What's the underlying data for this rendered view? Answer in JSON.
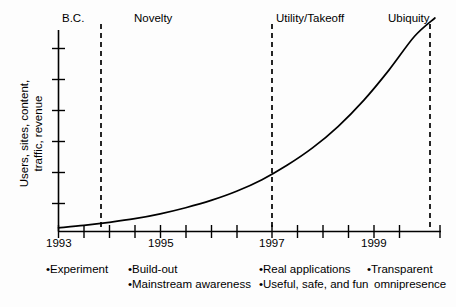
{
  "chart_data": {
    "type": "line",
    "title": "",
    "xlabel": "",
    "ylabel": "Users, sites, content, traffic, revenue",
    "ylabel_lines": [
      "Users, sites, content,",
      "traffic, revenue"
    ],
    "xlim": [
      1993,
      2000.5
    ],
    "ylim": [
      0,
      7
    ],
    "grid": false,
    "legend": null,
    "x_tick_labels": [
      "1993",
      "1995",
      "1997",
      "1999"
    ],
    "x_tick_values": [
      1993,
      1995,
      1997,
      1999
    ],
    "x_minor_tick_values": [
      1993,
      1993.5,
      1994,
      1994.5,
      1995,
      1995.5,
      1996,
      1996.5,
      1997,
      1997.5,
      1998,
      1998.5,
      1999,
      1999.5,
      2000
    ],
    "y_tick_labels": [],
    "y_tick_count": 6,
    "series": [
      {
        "name": "Internet growth",
        "x": [
          1993.0,
          1993.5,
          1994.0,
          1994.5,
          1995.0,
          1995.5,
          1996.0,
          1996.5,
          1997.0,
          1997.5,
          1998.0,
          1998.5,
          1999.0,
          1999.5,
          2000.0,
          2000.4
        ],
        "values": [
          0.12,
          0.2,
          0.3,
          0.42,
          0.58,
          0.78,
          1.02,
          1.32,
          1.7,
          2.18,
          2.75,
          3.45,
          4.3,
          5.3,
          6.4,
          7.0
        ]
      }
    ],
    "phase_boundaries": [
      1994.0,
      1997.0,
      2000.0
    ],
    "phases": [
      {
        "label": "B.C.",
        "center_x": 1993.3
      },
      {
        "label": "Novelty",
        "center_x": 1995.2
      },
      {
        "label": "Utility/Takeoff",
        "center_x": 1997.9
      },
      {
        "label": "Ubiquity",
        "center_x": 2000.2
      }
    ],
    "annotations": [
      {
        "group": "B.C.",
        "items": [
          "•Experiment"
        ]
      },
      {
        "group": "Novelty",
        "items": [
          "•Build-out",
          "•Mainstream awareness"
        ]
      },
      {
        "group": "Utility/Takeoff",
        "items": [
          "•Real applications",
          "•Useful, safe, and fun"
        ]
      },
      {
        "group": "Ubiquity",
        "items": [
          "•Transparent",
          "omnipresence"
        ]
      }
    ],
    "colors": {
      "background": "#fdfdfd",
      "axis": "#000000",
      "curve": "#000000",
      "dashed_divider": "#000000",
      "text": "#000000"
    }
  },
  "phase_labels": {
    "bc": "B.C.",
    "novelty": "Novelty",
    "utility": "Utility/Takeoff",
    "ubiquity": "Ubiquity"
  },
  "axis": {
    "y_label_line1": "Users, sites, content,",
    "y_label_line2": "traffic, revenue",
    "x_tick_1993": "1993",
    "x_tick_1995": "1995",
    "x_tick_1997": "1997",
    "x_tick_1999": "1999"
  },
  "bullets": {
    "bc_1": "•Experiment",
    "novelty_1": "•Build-out",
    "novelty_2": "•Mainstream awareness",
    "utility_1": "•Real applications",
    "utility_2": "•Useful, safe, and fun",
    "ubiquity_1": "•Transparent",
    "ubiquity_2": "omnipresence"
  }
}
